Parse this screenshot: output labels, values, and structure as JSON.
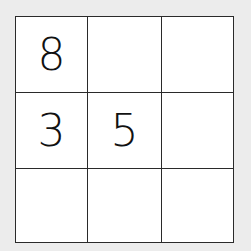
{
  "board": {
    "rows": 3,
    "cols": 3,
    "cells": [
      [
        "8",
        "",
        ""
      ],
      [
        "3",
        "5",
        ""
      ],
      [
        "",
        "",
        ""
      ]
    ]
  },
  "colors": {
    "background": "#ececec",
    "cell": "#ffffff",
    "line": "#2a2a2a",
    "digit": "#111111"
  }
}
